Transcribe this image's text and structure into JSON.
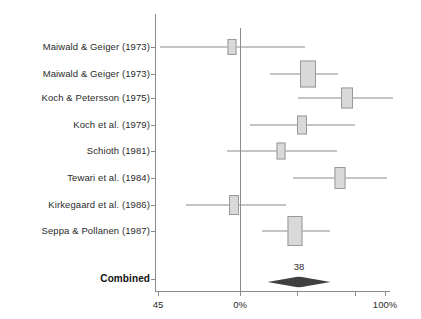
{
  "figure": {
    "type": "forest-plot",
    "background_color": "#ffffff",
    "box_fill_color": "#d9d9d9",
    "box_border_color": "#999999",
    "line_color": "#8c8c8c",
    "diamond_color": "#404040",
    "text_color": "#2b2b2b"
  },
  "axis": {
    "ticks": [
      {
        "label": "45",
        "x_px": 158
      },
      {
        "label": "0%",
        "x_px": 240
      },
      {
        "label": "",
        "x_px": 297
      },
      {
        "label": "",
        "x_px": 355
      },
      {
        "label": "100%",
        "x_px": 385
      }
    ],
    "line_left_px": 155,
    "line_right_px": 390,
    "baseline_y_px": 291
  },
  "chart_data": {
    "type": "forest",
    "title": "",
    "xlabel": "",
    "ylabel": "",
    "xlim_labels": [
      "45",
      "0%",
      "100%"
    ],
    "grid": false,
    "legend": null,
    "zero_reference_x_px": 240,
    "studies": [
      {
        "label": "Maiwald & Geiger (1973)",
        "center_px": 232,
        "ci_low_px": 160,
        "ci_high_px": 305,
        "box_width_px": 9,
        "box_height_px": 16,
        "row_y_px": 47
      },
      {
        "label": "Maiwald & Geiger (1973)",
        "center_px": 308,
        "ci_low_px": 270,
        "ci_high_px": 338,
        "box_width_px": 16,
        "box_height_px": 27,
        "row_y_px": 74
      },
      {
        "label": "Koch & Petersson (1975)",
        "center_px": 347,
        "ci_low_px": 298,
        "ci_high_px": 393,
        "box_width_px": 12,
        "box_height_px": 21,
        "row_y_px": 98
      },
      {
        "label": "Koch et al. (1979)",
        "center_px": 302,
        "ci_low_px": 250,
        "ci_high_px": 355,
        "box_width_px": 10,
        "box_height_px": 19,
        "row_y_px": 125
      },
      {
        "label": "Schioth (1981)",
        "center_px": 281,
        "ci_low_px": 227,
        "ci_high_px": 337,
        "box_width_px": 9,
        "box_height_px": 17,
        "row_y_px": 151
      },
      {
        "label": "Tewari et al. (1984)",
        "center_px": 340,
        "ci_low_px": 293,
        "ci_high_px": 387,
        "box_width_px": 11,
        "box_height_px": 22,
        "row_y_px": 178
      },
      {
        "label": "Kirkegaard et al. (1986)",
        "center_px": 234,
        "ci_low_px": 186,
        "ci_high_px": 286,
        "box_width_px": 10,
        "box_height_px": 20,
        "row_y_px": 205
      },
      {
        "label": "Seppa & Pollanen (1987)",
        "center_px": 295,
        "ci_low_px": 262,
        "ci_high_px": 330,
        "box_width_px": 15,
        "box_height_px": 30,
        "row_y_px": 231
      }
    ],
    "combined": {
      "label": "Combined",
      "value_label": "38",
      "center_px": 299,
      "ci_low_px": 268,
      "ci_high_px": 331,
      "row_y_px": 279,
      "diamond_height_px": 11
    }
  }
}
